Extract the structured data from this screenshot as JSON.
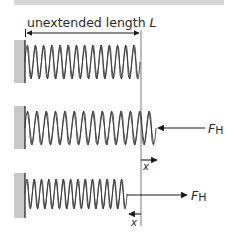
{
  "title_bar": {
    "color": "#d6d6d6"
  },
  "dimension": {
    "label": "unextended length",
    "symbol": "L"
  },
  "force_label": {
    "main": "F",
    "sub": "H"
  },
  "displacement_label": "x",
  "colors": {
    "wall": "#c8c8c8",
    "line": "#1a1a1a",
    "spring": "#3a3a3a",
    "reference_line": "#555555"
  },
  "springs": [
    {
      "name": "unextended",
      "start_x": 25,
      "end_x": 140,
      "y_center": 62,
      "coils": 14,
      "force": "none"
    },
    {
      "name": "compressed-force-left",
      "start_x": 25,
      "end_x": 156,
      "y_center": 128,
      "coils": 14,
      "force": "left",
      "displacement": "right"
    },
    {
      "name": "extended-force-right",
      "start_x": 25,
      "end_x": 127,
      "y_center": 194,
      "coils": 14,
      "force": "right",
      "displacement": "left"
    }
  ]
}
